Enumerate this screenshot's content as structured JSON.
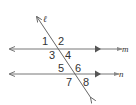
{
  "diagram": {
    "type": "parallel-lines-transversal",
    "colors": {
      "line": "#555555",
      "text": "#333333",
      "background": "#ffffff"
    },
    "lines": {
      "transversal": {
        "label": "ℓ"
      },
      "top_parallel": {
        "label": "m"
      },
      "bottom_parallel": {
        "label": "n"
      }
    },
    "angles": [
      {
        "id": "1",
        "label": "1"
      },
      {
        "id": "2",
        "label": "2"
      },
      {
        "id": "3",
        "label": "3"
      },
      {
        "id": "4",
        "label": "4"
      },
      {
        "id": "5",
        "label": "5"
      },
      {
        "id": "6",
        "label": "6"
      },
      {
        "id": "7",
        "label": "7"
      },
      {
        "id": "8",
        "label": "8"
      }
    ]
  }
}
